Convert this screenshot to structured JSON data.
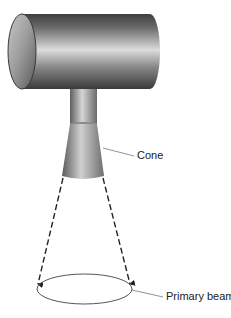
{
  "diagram": {
    "labels": {
      "cone": "Cone",
      "primary_beam": "Primary beam"
    },
    "colors": {
      "background": "#ffffff",
      "metal_dark": "#4a4a4a",
      "metal_light": "#d8d8d8",
      "line": "#333333",
      "leader": "#777777",
      "ellipse": "#555555"
    }
  }
}
